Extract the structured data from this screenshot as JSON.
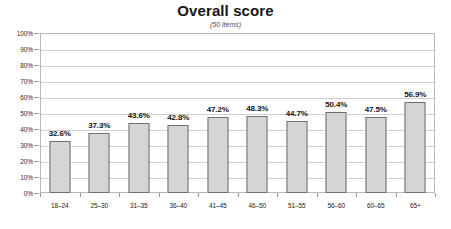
{
  "chart_data": {
    "type": "bar",
    "title": "Overall score",
    "subtitle": "(50 items)",
    "xlabel": "",
    "ylabel": "",
    "ylim": [
      0,
      100
    ],
    "ytick_labels": [
      "100%",
      "90%",
      "80%",
      "70%",
      "60%",
      "50%",
      "40%",
      "30%",
      "20%",
      "10%",
      "0%"
    ],
    "ytick_values": [
      100,
      90,
      80,
      70,
      60,
      50,
      40,
      30,
      20,
      10,
      0
    ],
    "grid": true,
    "legend": false,
    "categories": [
      "18–24",
      "25–30",
      "31–35",
      "36–40",
      "41–45",
      "46–50",
      "51–55",
      "56–60",
      "60–65",
      "65+"
    ],
    "values": [
      32.6,
      37.3,
      43.6,
      42.8,
      47.2,
      48.3,
      44.7,
      50.4,
      47.5,
      56.9
    ],
    "value_labels": [
      "32.6%",
      "37.3%",
      "43.6%",
      "42.8%",
      "47.2%",
      "48.3%",
      "44.7%",
      "50.4%",
      "47.5%",
      "56.9%"
    ],
    "colors": {
      "bar_fill": "#d5d5d5",
      "bar_border": "#6f6f6f",
      "gridline": "#cfcfcf",
      "plot_border": "#b9b9b9",
      "text": "#1a1a1a",
      "background": "#ffffff"
    }
  }
}
